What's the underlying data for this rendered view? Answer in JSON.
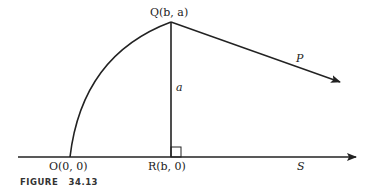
{
  "figure": {
    "caption_prefix": "FIGURE",
    "caption_number": "34.13"
  },
  "points": {
    "Q": "Q(b, a)",
    "O": "O(0, 0)",
    "R": "R(b, 0)"
  },
  "labels": {
    "side_a": "a",
    "vector_P": "P",
    "axis_S": "S"
  },
  "colors": {
    "stroke": "#222222",
    "background": "#ffffff"
  }
}
